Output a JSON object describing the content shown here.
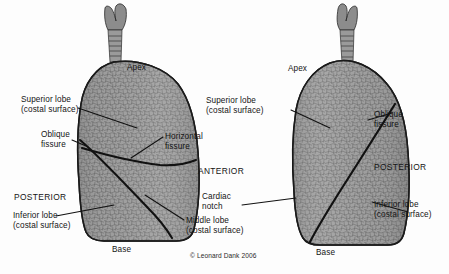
{
  "figure": {
    "background_color": "#fdfdfd",
    "tissue_color": "#9a9a9a",
    "outline_color": "#1a1a1a",
    "copyright": "© Leonard Dank 2006"
  },
  "left_panel": {
    "view_name": "ANTERIOR",
    "apex_label": "Apex",
    "base_label": "Base",
    "orientation_label": "POSTERIOR",
    "labels": [
      {
        "id": "superior-lobe",
        "line1": "Superior lobe",
        "line2": "(costal surface)"
      },
      {
        "id": "oblique-fissure",
        "line1": "Oblique",
        "line2": "fissure"
      },
      {
        "id": "horizontal-fissure",
        "line1": "Horizontal",
        "line2": "fissure"
      },
      {
        "id": "inferior-lobe",
        "line1": "Inferior lobe",
        "line2": "(costal surface)"
      },
      {
        "id": "middle-lobe",
        "line1": "Middle lobe",
        "line2": "(costal surface)"
      }
    ]
  },
  "center": {
    "anterior_label": "ANTERIOR",
    "cardiac_notch_line1": "Cardiac",
    "cardiac_notch_line2": "notch"
  },
  "right_panel": {
    "view_name": "POSTERIOR",
    "apex_label": "Apex",
    "base_label": "Base",
    "orientation_label": "POSTERIOR",
    "labels": [
      {
        "id": "superior-lobe",
        "line1": "Superior lobe",
        "line2": "(costal surface)"
      },
      {
        "id": "oblique-fissure",
        "line1": "Oblique",
        "line2": "fissure"
      },
      {
        "id": "inferior-lobe",
        "line1": "Inferior lobe",
        "line2": "(costal surface)"
      }
    ]
  }
}
